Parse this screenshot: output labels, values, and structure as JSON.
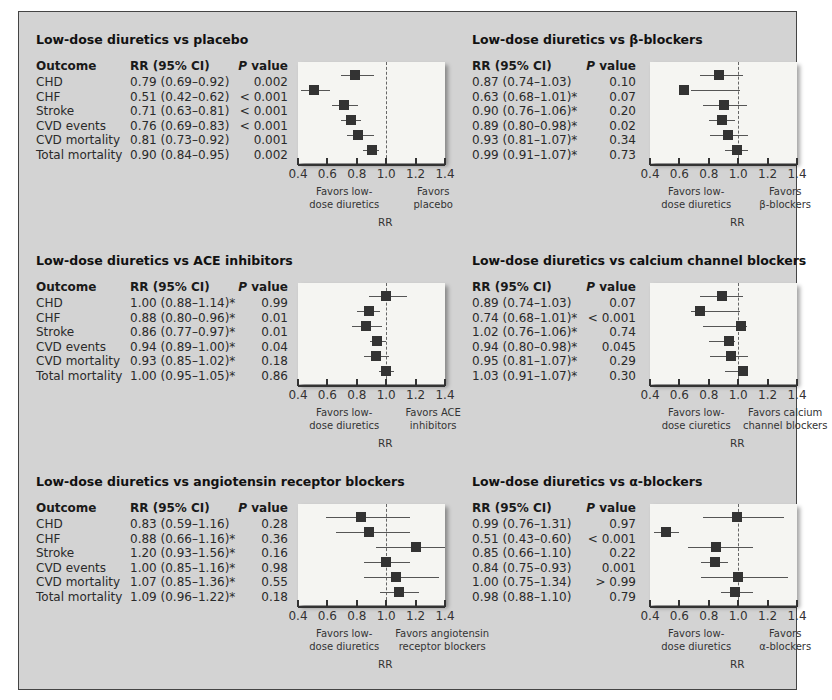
{
  "headers": {
    "outcome": "Outcome",
    "rr": "RR (95% CI)",
    "p_italic": "P",
    "p_rest": " value"
  },
  "axis": {
    "ticks": [
      "0.4",
      "0.6",
      "0.8",
      "1.0",
      "1.2",
      "1.4"
    ],
    "label": "RR"
  },
  "panels": [
    {
      "title": "Low-dose diuretics vs placebo",
      "favor_left": "Favors low-\ndose diuretics",
      "favor_right": "Favors\nplacebo",
      "rows": [
        {
          "outcome": "CHD",
          "rr": "0.79 (0.69–0.92)",
          "p": "0.002"
        },
        {
          "outcome": "CHF",
          "rr": "0.51 (0.42–0.62)",
          "p": "< 0.001"
        },
        {
          "outcome": "Stroke",
          "rr": "0.71 (0.63–0.81)",
          "p": "< 0.001"
        },
        {
          "outcome": "CVD events",
          "rr": "0.76 (0.69–0.83)",
          "p": "< 0.001"
        },
        {
          "outcome": "CVD mortality",
          "rr": "0.81 (0.73–0.92)",
          "p": "0.001"
        },
        {
          "outcome": "Total mortality",
          "rr": "0.90 (0.84–0.95)",
          "p": "0.002"
        }
      ]
    },
    {
      "title": "Low-dose diuretics vs β-blockers",
      "favor_left": "Favors low-\ndose diuretics",
      "favor_right": "Favors\nβ-blockers",
      "rows": [
        {
          "outcome": "CHD",
          "rr": "0.87 (0.74–1.03)",
          "p": "0.10"
        },
        {
          "outcome": "CHF",
          "rr": "0.63 (0.68–1.01)*",
          "p": "0.07"
        },
        {
          "outcome": "Stroke",
          "rr": "0.90 (0.76–1.06)*",
          "p": "0.20"
        },
        {
          "outcome": "CVD events",
          "rr": "0.89 (0.80–0.98)*",
          "p": "0.02"
        },
        {
          "outcome": "CVD mortality",
          "rr": "0.93 (0.81–1.07)*",
          "p": "0.34"
        },
        {
          "outcome": "Total mortality",
          "rr": "0.99 (0.91–1.07)*",
          "p": "0.73"
        }
      ]
    },
    {
      "title": "Low-dose diuretics vs ACE inhibitors",
      "favor_left": "Favors low-\ndose diuretics",
      "favor_right": "Favors ACE\ninhibitors",
      "rows": [
        {
          "outcome": "CHD",
          "rr": "1.00 (0.88–1.14)*",
          "p": "0.99"
        },
        {
          "outcome": "CHF",
          "rr": "0.88 (0.80–0.96)*",
          "p": "0.01"
        },
        {
          "outcome": "Stroke",
          "rr": "0.86 (0.77–0.97)*",
          "p": "0.01"
        },
        {
          "outcome": "CVD events",
          "rr": "0.94 (0.89–1.00)*",
          "p": "0.04"
        },
        {
          "outcome": "CVD mortality",
          "rr": "0.93 (0.85–1.02)*",
          "p": "0.18"
        },
        {
          "outcome": "Total mortality",
          "rr": "1.00 (0.95–1.05)*",
          "p": "0.86"
        }
      ]
    },
    {
      "title": "Low-dose diuretics vs calcium channel blockers",
      "favor_left": "Favors low-\ndose ciuretics",
      "favor_right": "Favors calcium\nchannel blockers",
      "rows": [
        {
          "outcome": "CHD",
          "rr": "0.89 (0.74–1.03)",
          "p": "0.07"
        },
        {
          "outcome": "CHF",
          "rr": "0.74 (0.68–1.01)*",
          "p": "< 0.001"
        },
        {
          "outcome": "Stroke",
          "rr": "1.02 (0.76–1.06)*",
          "p": "0.74"
        },
        {
          "outcome": "CVD events",
          "rr": "0.94 (0.80–0.98)*",
          "p": "0.045"
        },
        {
          "outcome": "CVD mortality",
          "rr": "0.95 (0.81–1.07)*",
          "p": "0.29"
        },
        {
          "outcome": "Total mortality",
          "rr": "1.03 (0.91–1.07)*",
          "p": "0.30"
        }
      ]
    },
    {
      "title": "Low-dose diuretics vs angiotensin receptor blockers",
      "favor_left": "Favors low-\ndose diuretics",
      "favor_right": "Favors angiotensin\nreceptor blockers",
      "rows": [
        {
          "outcome": "CHD",
          "rr": "0.83 (0.59–1.16)",
          "p": "0.28"
        },
        {
          "outcome": "CHF",
          "rr": "0.88 (0.66–1.16)*",
          "p": "0.36"
        },
        {
          "outcome": "Stroke",
          "rr": "1.20 (0.93–1.56)*",
          "p": "0.16"
        },
        {
          "outcome": "CVD events",
          "rr": "1.00 (0.85–1.16)*",
          "p": "0.98"
        },
        {
          "outcome": "CVD mortality",
          "rr": "1.07 (0.85–1.36)*",
          "p": "0.55"
        },
        {
          "outcome": "Total mortality",
          "rr": "1.09 (0.96–1.22)*",
          "p": "0.18"
        }
      ]
    },
    {
      "title": "Low-dose diuretics vs α-blockers",
      "favor_left": "Favors low-\ndose diuretics",
      "favor_right": "Favors\nα-blockers",
      "rows": [
        {
          "outcome": "CHD",
          "rr": "0.99 (0.76–1.31)",
          "p": "0.97"
        },
        {
          "outcome": "CHF",
          "rr": "0.51 (0.43–0.60)",
          "p": "< 0.001"
        },
        {
          "outcome": "Stroke",
          "rr": "0.85 (0.66–1.10)",
          "p": "0.22"
        },
        {
          "outcome": "CVD events",
          "rr": "0.84 (0.75–0.93)",
          "p": "0.001"
        },
        {
          "outcome": "CVD mortality",
          "rr": "1.00 (0.75–1.34)",
          "p": "> 0.99"
        },
        {
          "outcome": "Total mortality",
          "rr": "0.98 (0.88–1.10)",
          "p": "0.79"
        }
      ]
    }
  ],
  "chart_data": [
    {
      "type": "scatter",
      "subtype": "forest_plot",
      "title": "Low-dose diuretics vs placebo",
      "xlabel": "RR",
      "xlim": [
        0.4,
        1.4
      ],
      "reference_line": 1.0,
      "xticks": [
        0.4,
        0.6,
        0.8,
        1.0,
        1.2,
        1.4
      ],
      "annotations": [
        "Favors low-dose diuretics",
        "Favors placebo"
      ],
      "categories": [
        "CHD",
        "CHF",
        "Stroke",
        "CVD events",
        "CVD mortality",
        "Total mortality"
      ],
      "rr": [
        0.79,
        0.51,
        0.71,
        0.76,
        0.81,
        0.9
      ],
      "ci_low": [
        0.69,
        0.42,
        0.63,
        0.69,
        0.73,
        0.84
      ],
      "ci_high": [
        0.92,
        0.62,
        0.81,
        0.83,
        0.92,
        0.95
      ],
      "p_value": [
        "0.002",
        "< 0.001",
        "< 0.001",
        "< 0.001",
        "0.001",
        "0.002"
      ]
    },
    {
      "type": "scatter",
      "subtype": "forest_plot",
      "title": "Low-dose diuretics vs β-blockers",
      "xlabel": "RR",
      "xlim": [
        0.4,
        1.4
      ],
      "reference_line": 1.0,
      "xticks": [
        0.4,
        0.6,
        0.8,
        1.0,
        1.2,
        1.4
      ],
      "annotations": [
        "Favors low-dose diuretics",
        "Favors β-blockers"
      ],
      "categories": [
        "CHD",
        "CHF",
        "Stroke",
        "CVD events",
        "CVD mortality",
        "Total mortality"
      ],
      "rr": [
        0.87,
        0.63,
        0.9,
        0.89,
        0.93,
        0.99
      ],
      "ci_low": [
        0.74,
        0.68,
        0.76,
        0.8,
        0.81,
        0.91
      ],
      "ci_high": [
        1.03,
        1.01,
        1.06,
        0.98,
        1.07,
        1.07
      ],
      "p_value": [
        "0.10",
        "0.07",
        "0.20",
        "0.02",
        "0.34",
        "0.73"
      ]
    },
    {
      "type": "scatter",
      "subtype": "forest_plot",
      "title": "Low-dose diuretics vs ACE inhibitors",
      "xlabel": "RR",
      "xlim": [
        0.4,
        1.4
      ],
      "reference_line": 1.0,
      "xticks": [
        0.4,
        0.6,
        0.8,
        1.0,
        1.2,
        1.4
      ],
      "annotations": [
        "Favors low-dose diuretics",
        "Favors ACE inhibitors"
      ],
      "categories": [
        "CHD",
        "CHF",
        "Stroke",
        "CVD events",
        "CVD mortality",
        "Total mortality"
      ],
      "rr": [
        1.0,
        0.88,
        0.86,
        0.94,
        0.93,
        1.0
      ],
      "ci_low": [
        0.88,
        0.8,
        0.77,
        0.89,
        0.85,
        0.95
      ],
      "ci_high": [
        1.14,
        0.96,
        0.97,
        1.0,
        1.02,
        1.05
      ],
      "p_value": [
        "0.99",
        "0.01",
        "0.01",
        "0.04",
        "0.18",
        "0.86"
      ]
    },
    {
      "type": "scatter",
      "subtype": "forest_plot",
      "title": "Low-dose diuretics vs calcium channel blockers",
      "xlabel": "RR",
      "xlim": [
        0.4,
        1.4
      ],
      "reference_line": 1.0,
      "xticks": [
        0.4,
        0.6,
        0.8,
        1.0,
        1.2,
        1.4
      ],
      "annotations": [
        "Favors low-dose ciuretics",
        "Favors calcium channel blockers"
      ],
      "categories": [
        "CHD",
        "CHF",
        "Stroke",
        "CVD events",
        "CVD mortality",
        "Total mortality"
      ],
      "rr": [
        0.89,
        0.74,
        1.02,
        0.94,
        0.95,
        1.03
      ],
      "ci_low": [
        0.74,
        0.68,
        0.76,
        0.8,
        0.81,
        0.91
      ],
      "ci_high": [
        1.03,
        1.01,
        1.06,
        0.98,
        1.07,
        1.07
      ],
      "p_value": [
        "0.07",
        "< 0.001",
        "0.74",
        "0.045",
        "0.29",
        "0.30"
      ]
    },
    {
      "type": "scatter",
      "subtype": "forest_plot",
      "title": "Low-dose diuretics vs angiotensin receptor blockers",
      "xlabel": "RR",
      "xlim": [
        0.4,
        1.4
      ],
      "reference_line": 1.0,
      "xticks": [
        0.4,
        0.6,
        0.8,
        1.0,
        1.2,
        1.4
      ],
      "annotations": [
        "Favors low-dose diuretics",
        "Favors angiotensin receptor blockers"
      ],
      "categories": [
        "CHD",
        "CHF",
        "Stroke",
        "CVD events",
        "CVD mortality",
        "Total mortality"
      ],
      "rr": [
        0.83,
        0.88,
        1.2,
        1.0,
        1.07,
        1.09
      ],
      "ci_low": [
        0.59,
        0.66,
        0.93,
        0.85,
        0.85,
        0.96
      ],
      "ci_high": [
        1.16,
        1.16,
        1.56,
        1.16,
        1.36,
        1.22
      ],
      "p_value": [
        "0.28",
        "0.36",
        "0.16",
        "0.98",
        "0.55",
        "0.18"
      ]
    },
    {
      "type": "scatter",
      "subtype": "forest_plot",
      "title": "Low-dose diuretics vs α-blockers",
      "xlabel": "RR",
      "xlim": [
        0.4,
        1.4
      ],
      "reference_line": 1.0,
      "xticks": [
        0.4,
        0.6,
        0.8,
        1.0,
        1.2,
        1.4
      ],
      "annotations": [
        "Favors low-dose diuretics",
        "Favors α-blockers"
      ],
      "categories": [
        "CHD",
        "CHF",
        "Stroke",
        "CVD events",
        "CVD mortality",
        "Total mortality"
      ],
      "rr": [
        0.99,
        0.51,
        0.85,
        0.84,
        1.0,
        0.98
      ],
      "ci_low": [
        0.76,
        0.43,
        0.66,
        0.75,
        0.75,
        0.88
      ],
      "ci_high": [
        1.31,
        0.6,
        1.1,
        0.93,
        1.34,
        1.1
      ],
      "p_value": [
        "0.97",
        "< 0.001",
        "0.22",
        "0.001",
        "> 0.99",
        "0.79"
      ]
    }
  ]
}
